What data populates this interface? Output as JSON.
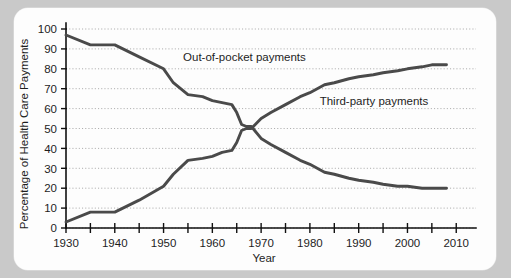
{
  "figure": {
    "background_color": "#c9c9c9",
    "panel_color": "#fdfdfd",
    "line_color": "#4a4a4a",
    "grid_color": "#9a9a9a"
  },
  "chart_data": {
    "type": "line",
    "title": "",
    "xlabel": "Year",
    "ylabel": "Percentage of Health Care Payments",
    "xlim": [
      1930,
      2012
    ],
    "ylim": [
      0,
      100
    ],
    "grid": true,
    "legend_position": "inline-annotations",
    "xticks": [
      1930,
      1935,
      1940,
      1945,
      1950,
      1955,
      1960,
      1965,
      1970,
      1975,
      1980,
      1985,
      1990,
      1995,
      2000,
      2005,
      2010
    ],
    "xtick_labels": [
      "1930",
      "",
      "1940",
      "",
      "1950",
      "",
      "1960",
      "",
      "1970",
      "",
      "1980",
      "",
      "1990",
      "",
      "2000",
      "",
      "2010"
    ],
    "yticks": [
      0,
      10,
      20,
      30,
      40,
      50,
      60,
      70,
      80,
      90,
      100
    ],
    "ytick_labels": [
      "0",
      "10",
      "20",
      "30",
      "40",
      "50",
      "60",
      "70",
      "80",
      "90",
      "100"
    ],
    "series": [
      {
        "name": "Out-of-pocket payments",
        "label_x": 1954,
        "label_y": 84,
        "x": [
          1930,
          1935,
          1940,
          1945,
          1950,
          1952,
          1955,
          1958,
          1960,
          1962,
          1964,
          1965,
          1966,
          1967,
          1968,
          1970,
          1972,
          1975,
          1978,
          1980,
          1983,
          1985,
          1988,
          1990,
          1993,
          1995,
          1998,
          2000,
          2003,
          2005,
          2008
        ],
        "y": [
          97,
          92,
          92,
          86,
          80,
          73,
          67,
          66,
          64,
          63,
          62,
          58,
          52,
          51,
          51,
          45,
          42,
          38,
          34,
          32,
          28,
          27,
          25,
          24,
          23,
          22,
          21,
          21,
          20,
          20,
          20
        ]
      },
      {
        "name": "Third-party payments",
        "label_x": 1982,
        "label_y": 62,
        "x": [
          1930,
          1935,
          1940,
          1945,
          1950,
          1952,
          1955,
          1958,
          1960,
          1962,
          1964,
          1965,
          1966,
          1967,
          1968,
          1970,
          1972,
          1975,
          1978,
          1980,
          1983,
          1985,
          1988,
          1990,
          1993,
          1995,
          1998,
          2000,
          2003,
          2005,
          2008
        ],
        "y": [
          3,
          8,
          8,
          14,
          21,
          27,
          34,
          35,
          36,
          38,
          39,
          43,
          49,
          50,
          50,
          55,
          58,
          62,
          66,
          68,
          72,
          73,
          75,
          76,
          77,
          78,
          79,
          80,
          81,
          82,
          82
        ]
      }
    ]
  }
}
